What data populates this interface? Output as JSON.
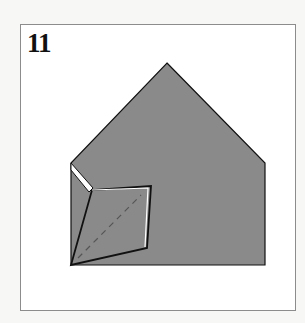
{
  "step": {
    "number": "11"
  },
  "diagram": {
    "paper_color": "#8a8a8a",
    "outline_color": "#111111",
    "crease_color": "#555555",
    "shape_points": "167,63 265,163 265,265 71,265 71,163",
    "flap_points": "71,265 92,190 151,186 147,248",
    "white_strip_points": "71,163 71,170 89,192 93,188",
    "flap_edge_highlight": "92,190 148,188 145,247",
    "valley_fold_line": {
      "x1": 78,
      "y1": 258,
      "x2": 141,
      "y2": 195
    }
  }
}
